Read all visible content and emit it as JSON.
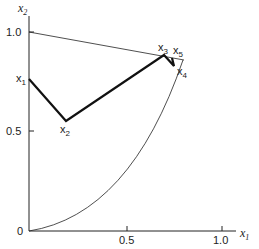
{
  "axes": {
    "x_label": "x",
    "x_sub": "1",
    "y_label": "x",
    "y_sub": "2",
    "x_ticks": [
      "0.5",
      "1.0"
    ],
    "y_ticks": [
      "1.0",
      "0.5",
      "0"
    ]
  },
  "points": [
    {
      "name": "x",
      "sub": "1"
    },
    {
      "name": "x",
      "sub": "2"
    },
    {
      "name": "x",
      "sub": "3"
    },
    {
      "name": "x",
      "sub": "4"
    },
    {
      "name": "x",
      "sub": "5"
    }
  ]
}
